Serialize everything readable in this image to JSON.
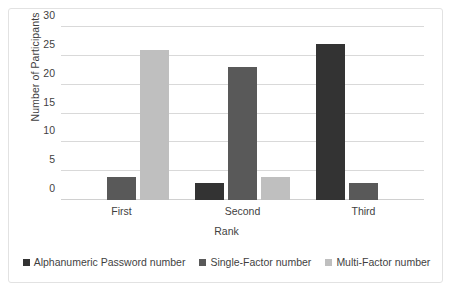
{
  "chart_data": {
    "type": "bar",
    "title": "",
    "subtitle": "",
    "xlabel": "Rank",
    "ylabel": "Number of Participants",
    "categories": [
      "First",
      "Second",
      "Third"
    ],
    "series": [
      {
        "name": "Alphanumeric Password number",
        "color": "#333333",
        "values": [
          0,
          3,
          27
        ]
      },
      {
        "name": "Single-Factor number",
        "color": "#595959",
        "values": [
          4,
          23,
          3
        ]
      },
      {
        "name": "Multi-Factor number",
        "color": "#bfbfbf",
        "values": [
          26,
          4,
          0
        ]
      }
    ],
    "ylim": [
      0,
      30
    ],
    "yticks": [
      0,
      5,
      10,
      15,
      20,
      25,
      30
    ],
    "grid": "horizontal",
    "legend_position": "bottom",
    "annotations": []
  }
}
